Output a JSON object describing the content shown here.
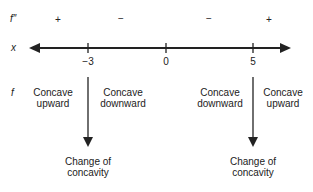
{
  "rows": {
    "f2_label": "f″",
    "x_label": "x",
    "f_label": "f"
  },
  "signs": [
    "+",
    "−",
    "−",
    "+"
  ],
  "ticks": [
    "−3",
    "0",
    "5"
  ],
  "intervals": [
    {
      "line1": "Concave",
      "line2": "upward"
    },
    {
      "line1": "Concave",
      "line2": "downward"
    },
    {
      "line1": "Concave",
      "line2": "downward"
    },
    {
      "line1": "Concave",
      "line2": "upward"
    }
  ],
  "changes": [
    {
      "line1": "Change of",
      "line2": "concavity"
    },
    {
      "line1": "Change of",
      "line2": "concavity"
    }
  ]
}
